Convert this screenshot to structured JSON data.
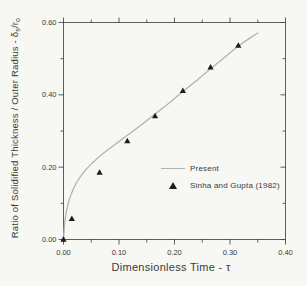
{
  "figure": {
    "background_color": "#f7f7f4",
    "frame_color": "#4d4d4d",
    "text_color": "#3a3a3a"
  },
  "chart_data": {
    "type": "line+scatter",
    "title": "",
    "xlabel": "Dimensionless Time - τ",
    "ylabel_plain": "Ratio of Solidified Thickness / Outer Radius - δs/ro",
    "ylabel_parts": {
      "prefix": "Ratio of Solidified Thickness / Outer Radius - ",
      "symbol": "δ",
      "symbol_sub": "s",
      "slash_r": "/r",
      "r_sub": "o"
    },
    "xlim": [
      0.0,
      0.4
    ],
    "ylim": [
      0.0,
      0.6
    ],
    "grid": false,
    "frame": "box-with-mirrored-ticks",
    "xticks": {
      "major": [
        0.0,
        0.1,
        0.2,
        0.3,
        0.4
      ],
      "labels": [
        "0.00",
        "0.10",
        "0.20",
        "0.30",
        "0.40"
      ],
      "minor": [
        0.05,
        0.15,
        0.25,
        0.35
      ]
    },
    "yticks": {
      "major": [
        0.0,
        0.2,
        0.4,
        0.6
      ],
      "labels": [
        "0.00",
        "0.20",
        "0.40",
        "0.60"
      ],
      "minor": [
        0.1,
        0.3,
        0.5
      ]
    },
    "legend": {
      "position": "inside-right-middle",
      "border": false
    },
    "series": [
      {
        "name": "Present",
        "style": "line",
        "color": "#b3b3b3",
        "points": [
          [
            0.0,
            0.0
          ],
          [
            0.002,
            0.045
          ],
          [
            0.004,
            0.066
          ],
          [
            0.006,
            0.083
          ],
          [
            0.008,
            0.096
          ],
          [
            0.01,
            0.108
          ],
          [
            0.014,
            0.126
          ],
          [
            0.018,
            0.141
          ],
          [
            0.024,
            0.159
          ],
          [
            0.03,
            0.173
          ],
          [
            0.04,
            0.193
          ],
          [
            0.05,
            0.209
          ],
          [
            0.065,
            0.23
          ],
          [
            0.08,
            0.248
          ],
          [
            0.1,
            0.271
          ],
          [
            0.12,
            0.294
          ],
          [
            0.14,
            0.317
          ],
          [
            0.165,
            0.347
          ],
          [
            0.19,
            0.377
          ],
          [
            0.215,
            0.409
          ],
          [
            0.24,
            0.44
          ],
          [
            0.265,
            0.472
          ],
          [
            0.29,
            0.503
          ],
          [
            0.315,
            0.535
          ],
          [
            0.335,
            0.556
          ],
          [
            0.35,
            0.571
          ]
        ]
      },
      {
        "name": "Sinha and Gupta  (1982)",
        "style": "scatter",
        "marker": "filled-triangle",
        "color": "#1c1c1c",
        "points": [
          [
            0.0,
            0.0
          ],
          [
            0.015,
            0.057
          ],
          [
            0.065,
            0.185
          ],
          [
            0.115,
            0.272
          ],
          [
            0.165,
            0.341
          ],
          [
            0.215,
            0.411
          ],
          [
            0.265,
            0.476
          ],
          [
            0.315,
            0.536
          ]
        ]
      }
    ]
  }
}
